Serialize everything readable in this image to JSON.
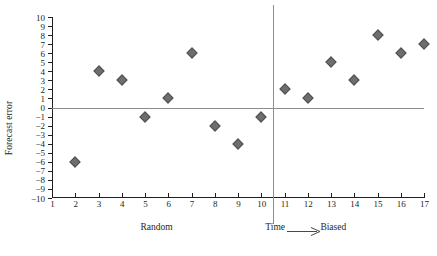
{
  "chart": {
    "ylabel": "Forecast error",
    "xlabel_left": "Random",
    "xlabel_center": "Time",
    "xlabel_right": "Biased",
    "arrow_icon": "right-arrow-icon",
    "marker_color": "#6e6e6e",
    "reference_line_color": "#8d8d8d",
    "axis_color": "#231f20"
  },
  "chart_data": {
    "type": "scatter",
    "title": "",
    "xlabel": "Time",
    "ylabel": "Forecast error",
    "xlim": [
      1,
      17
    ],
    "ylim": [
      -10,
      10
    ],
    "grid": false,
    "legend": null,
    "x": [
      2,
      3,
      4,
      5,
      6,
      7,
      8,
      9,
      10,
      11,
      12,
      13,
      14,
      15,
      16,
      17
    ],
    "values": [
      -6,
      4,
      3,
      -1,
      1,
      6,
      -2,
      -4,
      -1,
      2,
      1,
      5,
      3,
      8,
      6,
      7
    ],
    "xticks": [
      1,
      2,
      3,
      4,
      5,
      6,
      7,
      8,
      9,
      10,
      11,
      12,
      13,
      14,
      15,
      16,
      17
    ],
    "yticks": [
      10,
      9,
      8,
      7,
      6,
      5,
      4,
      3,
      2,
      1,
      0,
      -1,
      -2,
      -3,
      -4,
      -5,
      -6,
      -7,
      -8,
      -9,
      -10
    ],
    "ytick_labels": [
      "10",
      "9",
      "8",
      "7",
      "6",
      "5",
      "4",
      "3",
      "2",
      "1",
      "0",
      "−1",
      "−2",
      "−3",
      "−4",
      "−5",
      "−6",
      "−7",
      "−8",
      "−9",
      "−10"
    ],
    "reference_lines": [
      {
        "orientation": "horizontal",
        "value": 0
      },
      {
        "orientation": "vertical",
        "value": 10.5
      }
    ],
    "annotations": [
      {
        "text": "Random",
        "x": 5.5,
        "region": "left"
      },
      {
        "text": "Time",
        "x": 10.6,
        "region": "center"
      },
      {
        "text": "Biased",
        "x": 13.1,
        "region": "right"
      }
    ]
  }
}
